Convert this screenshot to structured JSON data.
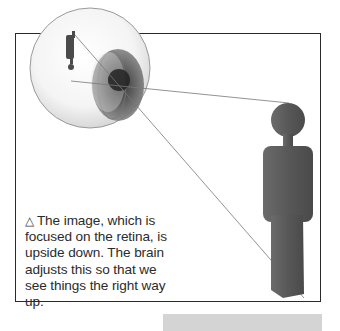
{
  "figure": {
    "caption_marker": "△",
    "caption": "The image, which is focused on the retina, is upside down. The brain adjusts this so that we see things the right way up.",
    "caption_lines": [
      "The image, which is",
      "focused on the retina, is",
      "upside down. The brain",
      "adjusts this so that we",
      "see things the right way",
      "up."
    ],
    "illustration": {
      "eye": "eyeball-cross-section",
      "inverted_image": "upside-down-figure-on-retina",
      "subject": "standing-figure"
    },
    "colors": {
      "frame": "#2a2a2a",
      "figure": "#5a5a5a",
      "text": "#2b2b2b",
      "bottom_bar": "#d4d4d4"
    }
  }
}
